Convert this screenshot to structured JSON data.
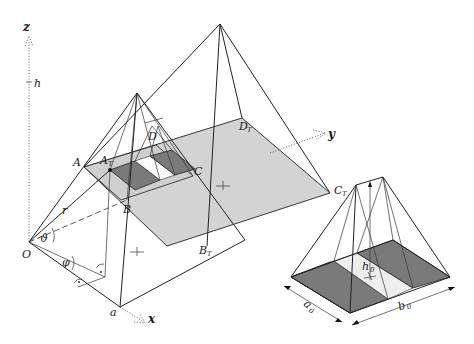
{
  "figure": {
    "colors": {
      "line": "#222222",
      "light_fill": "#d3d3d3",
      "dark_fill": "#7a7a7a",
      "white_fill": "#ffffff"
    },
    "axes": {
      "z": "z",
      "y": "y",
      "x": "x",
      "origin": "O",
      "height_tick": "h"
    },
    "points": {
      "A": "A",
      "B": "B",
      "C": "C",
      "D": "D",
      "AT": "A",
      "AT_sub": "T",
      "BT": "B",
      "BT_sub": "T",
      "CT": "C",
      "CT_sub": "T",
      "DT": "D",
      "DT_sub": "T",
      "a": "a"
    },
    "angles": {
      "theta": "ϑ",
      "phi": "φ",
      "r": "r"
    },
    "inset": {
      "h0": "h",
      "h0_sub": "0",
      "a0": "a",
      "a0_sub": "0",
      "b0": "b",
      "b0_sub": "0"
    }
  }
}
